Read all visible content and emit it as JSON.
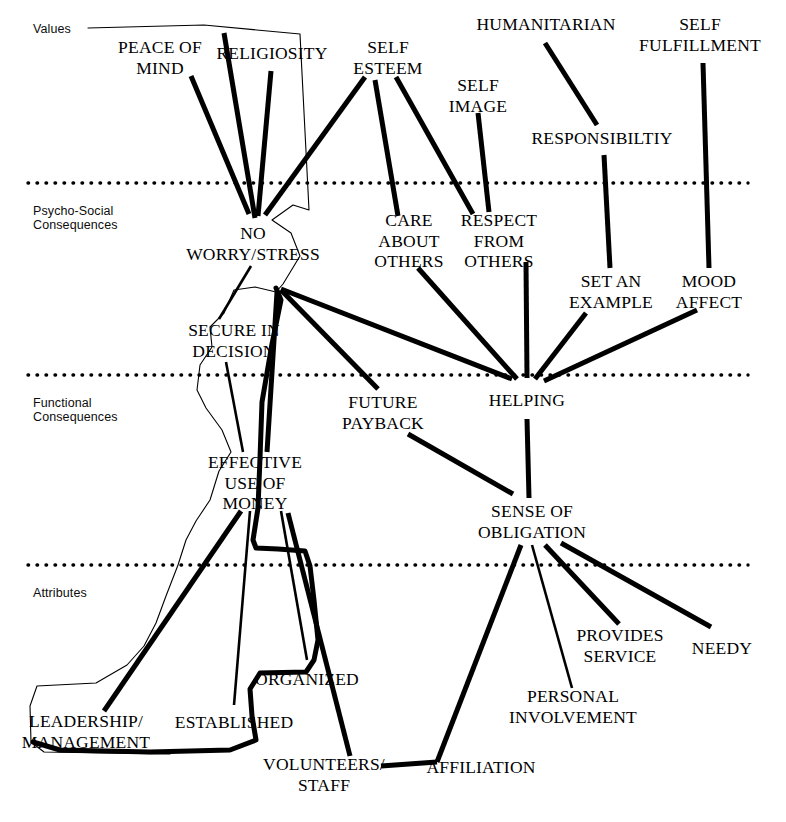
{
  "figure": {
    "type": "means-end-chain-ladder-diagram",
    "width": 786,
    "height": 822,
    "background_color": "#ffffff",
    "line_color": "#000000",
    "band_label_color": "#0d0d0d"
  },
  "bands": [
    {
      "id": "values",
      "label": "Values",
      "x": 33,
      "y": 22
    },
    {
      "id": "psycho_social",
      "label": "Psycho-Social\nConsequences",
      "x": 33,
      "y": 204
    },
    {
      "id": "functional",
      "label": "Functional\nConsequences",
      "x": 33,
      "y": 396
    },
    {
      "id": "attributes",
      "label": "Attributes",
      "x": 33,
      "y": 586
    }
  ],
  "dividers": [
    {
      "id": "divider-values-psycho",
      "y": 183,
      "x1": 28,
      "x2": 748,
      "style": "dotted"
    },
    {
      "id": "divider-psycho-functional",
      "y": 375,
      "x1": 28,
      "x2": 748,
      "style": "dotted"
    },
    {
      "id": "divider-functional-attributes",
      "y": 565,
      "x1": 28,
      "x2": 748,
      "style": "dotted"
    }
  ],
  "nodes": [
    {
      "id": "peace-of-mind",
      "label": "PEACE OF\nMIND",
      "x": 160,
      "y": 57,
      "band": "values"
    },
    {
      "id": "religiosity",
      "label": "RELIGIOSITY",
      "x": 272,
      "y": 53,
      "band": "values"
    },
    {
      "id": "self-esteem",
      "label": "SELF\nESTEEM",
      "x": 388,
      "y": 57,
      "band": "values"
    },
    {
      "id": "self-image",
      "label": "SELF\nIMAGE",
      "x": 478,
      "y": 95,
      "band": "values"
    },
    {
      "id": "humanitarian",
      "label": "HUMANITARIAN",
      "x": 546,
      "y": 24,
      "band": "values"
    },
    {
      "id": "self-fulfillment",
      "label": "SELF\nFULFILLMENT",
      "x": 700,
      "y": 34,
      "band": "values"
    },
    {
      "id": "responsibility",
      "label": "RESPONSIBILTIY",
      "x": 602,
      "y": 138,
      "band": "values"
    },
    {
      "id": "no-worry-stress",
      "label": "NO\nWORRY/STRESS",
      "x": 253,
      "y": 243,
      "band": "psycho_social"
    },
    {
      "id": "care-about-others",
      "label": "CARE\nABOUT\nOTHERS",
      "x": 409,
      "y": 241,
      "band": "psycho_social"
    },
    {
      "id": "respect-from-others",
      "label": "RESPECT\nFROM\nOTHERS",
      "x": 499,
      "y": 241,
      "band": "psycho_social"
    },
    {
      "id": "set-an-example",
      "label": "SET AN\nEXAMPLE",
      "x": 611,
      "y": 291,
      "band": "psycho_social"
    },
    {
      "id": "mood-affect",
      "label": "MOOD\nAFFECT",
      "x": 709,
      "y": 291,
      "band": "psycho_social"
    },
    {
      "id": "secure-in-decision",
      "label": "SECURE IN\nDECISION",
      "x": 234,
      "y": 340,
      "band": "psycho_social"
    },
    {
      "id": "future-payback",
      "label": "FUTURE\nPAYBACK",
      "x": 383,
      "y": 412,
      "band": "functional"
    },
    {
      "id": "helping",
      "label": "HELPING",
      "x": 527,
      "y": 400,
      "band": "functional"
    },
    {
      "id": "effective-use-of-money",
      "label": "EFFECTIVE\nUSE OF\nMONEY",
      "x": 255,
      "y": 483,
      "band": "functional"
    },
    {
      "id": "sense-of-obligation",
      "label": "SENSE OF\nOBLIGATION",
      "x": 532,
      "y": 521,
      "band": "functional"
    },
    {
      "id": "organized",
      "label": "ORGANIZED",
      "x": 307,
      "y": 679,
      "band": "attributes"
    },
    {
      "id": "provides-service",
      "label": "PROVIDES\nSERVICE",
      "x": 620,
      "y": 645,
      "band": "attributes"
    },
    {
      "id": "needy",
      "label": "NEEDY",
      "x": 722,
      "y": 648,
      "band": "attributes"
    },
    {
      "id": "leadership-management",
      "label": "LEADERSHIP/\nMANAGEMENT",
      "x": 86,
      "y": 731,
      "band": "attributes"
    },
    {
      "id": "established",
      "label": "ESTABLISHED",
      "x": 234,
      "y": 722,
      "band": "attributes"
    },
    {
      "id": "personal-involvement",
      "label": "PERSONAL\nINVOLVEMENT",
      "x": 573,
      "y": 706,
      "band": "attributes"
    },
    {
      "id": "volunteers-staff",
      "label": "VOLUNTEERS/\nSTAFF",
      "x": 324,
      "y": 774,
      "band": "attributes"
    },
    {
      "id": "affiliation",
      "label": "AFFILIATION",
      "x": 481,
      "y": 767,
      "band": "attributes"
    }
  ],
  "links": [
    {
      "id": "link-nws-peace",
      "from": "no-worry-stress",
      "to": "peace-of-mind",
      "weight": "thick",
      "x1": 249,
      "y1": 214,
      "x2": 191,
      "y2": 76
    },
    {
      "id": "link-nws-religiosity-a",
      "from": "no-worry-stress",
      "to": "religiosity-left",
      "weight": "thick",
      "x1": 255,
      "y1": 218,
      "x2": 224,
      "y2": 33
    },
    {
      "id": "link-nws-religiosity-b",
      "from": "no-worry-stress",
      "to": "religiosity",
      "weight": "thick",
      "x1": 258,
      "y1": 216,
      "x2": 271,
      "y2": 71
    },
    {
      "id": "link-nws-selfesteem",
      "from": "no-worry-stress",
      "to": "self-esteem",
      "weight": "thick",
      "x1": 265,
      "y1": 215,
      "x2": 365,
      "y2": 77
    },
    {
      "id": "link-secure-nws",
      "from": "secure-in-decision",
      "to": "no-worry-stress",
      "weight": "medium",
      "x1": 219,
      "y1": 319,
      "x2": 251,
      "y2": 266
    },
    {
      "id": "link-eum-secure",
      "from": "effective-use-of-money",
      "to": "secure-in-decision",
      "weight": "medium",
      "x1": 243,
      "y1": 452,
      "x2": 226,
      "y2": 362
    },
    {
      "id": "link-nws-future",
      "from": "no-worry-stress",
      "to": "future-payback",
      "weight": "thick",
      "x1": 281,
      "y1": 290,
      "x2": 378,
      "y2": 389
    },
    {
      "id": "link-nws-helping",
      "from": "no-worry-stress",
      "to": "helping",
      "weight": "thick",
      "x1": 281,
      "y1": 289,
      "x2": 512,
      "y2": 379
    },
    {
      "id": "link-nws-eum",
      "from": "no-worry-stress",
      "to": "effective-use-of-money",
      "weight": "thick",
      "x1": 277,
      "y1": 292,
      "x2": 267,
      "y2": 452
    },
    {
      "id": "link-care-selfesteem",
      "from": "care-about-others",
      "to": "self-esteem",
      "weight": "thick",
      "x1": 398,
      "y1": 216,
      "x2": 375,
      "y2": 80
    },
    {
      "id": "link-respect-selfesteem",
      "from": "respect-from-others",
      "to": "self-esteem",
      "weight": "thick",
      "x1": 473,
      "y1": 214,
      "x2": 396,
      "y2": 77
    },
    {
      "id": "link-respect-selfimage",
      "from": "respect-from-others",
      "to": "self-image",
      "weight": "thick",
      "x1": 489,
      "y1": 212,
      "x2": 478,
      "y2": 113
    },
    {
      "id": "link-setexample-resp",
      "from": "set-an-example",
      "to": "responsibility",
      "weight": "thick",
      "x1": 610,
      "y1": 268,
      "x2": 604,
      "y2": 155
    },
    {
      "id": "link-resp-humanitarian",
      "from": "responsibility",
      "to": "humanitarian",
      "weight": "thick",
      "x1": 597,
      "y1": 125,
      "x2": 545,
      "y2": 43
    },
    {
      "id": "link-mood-fulfillment",
      "from": "mood-affect",
      "to": "self-fulfillment",
      "weight": "thick",
      "x1": 709,
      "y1": 268,
      "x2": 703,
      "y2": 63
    },
    {
      "id": "link-helping-care",
      "from": "helping",
      "to": "care-about-others",
      "weight": "thick",
      "x1": 517,
      "y1": 379,
      "x2": 418,
      "y2": 268
    },
    {
      "id": "link-helping-respect",
      "from": "helping",
      "to": "respect-from-others",
      "weight": "thick",
      "x1": 527,
      "y1": 378,
      "x2": 526,
      "y2": 262
    },
    {
      "id": "link-helping-setexample",
      "from": "helping",
      "to": "set-an-example",
      "weight": "thick",
      "x1": 535,
      "y1": 379,
      "x2": 586,
      "y2": 313
    },
    {
      "id": "link-helping-mood",
      "from": "helping",
      "to": "mood-affect",
      "weight": "thick",
      "x1": 544,
      "y1": 381,
      "x2": 697,
      "y2": 310
    },
    {
      "id": "link-soo-helping",
      "from": "sense-of-obligation",
      "to": "helping",
      "weight": "thick",
      "x1": 529,
      "y1": 498,
      "x2": 527,
      "y2": 419
    },
    {
      "id": "link-soo-future",
      "from": "sense-of-obligation",
      "to": "future-payback",
      "weight": "thick",
      "x1": 513,
      "y1": 494,
      "x2": 408,
      "y2": 434
    },
    {
      "id": "link-soo-volunteers",
      "from": "sense-of-obligation",
      "to": "affiliation-vertex",
      "weight": "thick",
      "x1": 521,
      "y1": 545,
      "x2": 437,
      "y2": 762
    },
    {
      "id": "link-soo-personal",
      "from": "sense-of-obligation",
      "to": "personal-involvement",
      "weight": "medium",
      "x1": 532,
      "y1": 545,
      "x2": 572,
      "y2": 688
    },
    {
      "id": "link-soo-provides",
      "from": "sense-of-obligation",
      "to": "provides-service",
      "weight": "thick",
      "x1": 545,
      "y1": 545,
      "x2": 619,
      "y2": 624
    },
    {
      "id": "link-soo-needy",
      "from": "sense-of-obligation",
      "to": "needy",
      "weight": "thick",
      "x1": 561,
      "y1": 543,
      "x2": 711,
      "y2": 627
    },
    {
      "id": "link-eum-leadership",
      "from": "effective-use-of-money",
      "to": "leadership-management",
      "weight": "thick",
      "x1": 241,
      "y1": 511,
      "x2": 104,
      "y2": 711
    },
    {
      "id": "link-eum-established",
      "from": "effective-use-of-money",
      "to": "established",
      "weight": "medium",
      "x1": 250,
      "y1": 511,
      "x2": 234,
      "y2": 705
    },
    {
      "id": "link-eum-organized",
      "from": "effective-use-of-money",
      "to": "organized",
      "weight": "medium",
      "x1": 281,
      "y1": 511,
      "x2": 307,
      "y2": 660
    },
    {
      "id": "link-eum-volunteers",
      "from": "effective-use-of-money",
      "to": "volunteers-staff",
      "weight": "thick",
      "x1": 288,
      "y1": 513,
      "x2": 350,
      "y2": 756
    },
    {
      "id": "link-affiliation-vertex",
      "from": "affiliation",
      "to": "affiliation-vertex",
      "weight": "thick",
      "x1": 437,
      "y1": 762,
      "x2": 381,
      "y2": 766
    }
  ],
  "outlines": [
    {
      "id": "outline-thin-cluster",
      "weight": "thin",
      "description": "thin polygon enclosing the PEACE OF MIND / NO WORRY / SECURE / EFFECTIVE USE OF MONEY / LEADERSHIP chain",
      "points": "88,28 204,25 300,34 309,210 293,205 272,220 291,233 300,256 283,284 276,292 255,287 234,290 224,313 210,327 212,347 200,365 197,390 206,408 222,430 231,452 219,471 210,500 196,521 186,540 178,565 166,596 156,623 144,646 127,665 96,683 37,686 30,706 31,742 44,752 170,754"
    },
    {
      "id": "outline-thick-cluster",
      "weight": "thick",
      "description": "thick polygon enclosing ESTABLISHED / ORGANIZED / VOLUNTEERS-STAFF attribute cluster",
      "points": "276,288 281,300 272,344 262,402 260,458 258,508 253,540 256,548 278,549 305,551 310,566 314,600 318,640 314,660 306,672 260,673 250,689 252,716 256,740 230,750 150,752 60,750 33,742"
    }
  ],
  "footer": {
    "caption": ""
  }
}
